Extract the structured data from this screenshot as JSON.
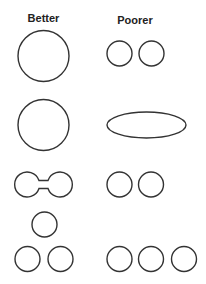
{
  "columns": {
    "better": "Better",
    "poorer": "Poorer"
  },
  "colors": {
    "stroke": "#333333",
    "text": "#222222",
    "background": "#ffffff"
  },
  "rows": [
    {
      "better": {
        "shape": "single-large-circle"
      },
      "poorer": {
        "shape": "two-separate-small-circles"
      }
    },
    {
      "better": {
        "shape": "single-large-circle"
      },
      "poorer": {
        "shape": "elongated-ellipse"
      }
    },
    {
      "better": {
        "shape": "two-circles-joined-by-neck"
      },
      "poorer": {
        "shape": "two-separate-small-circles"
      }
    },
    {
      "better": {
        "shape": "three-circles-triangle-arrangement"
      },
      "poorer": {
        "shape": "three-circles-in-a-row"
      }
    }
  ]
}
